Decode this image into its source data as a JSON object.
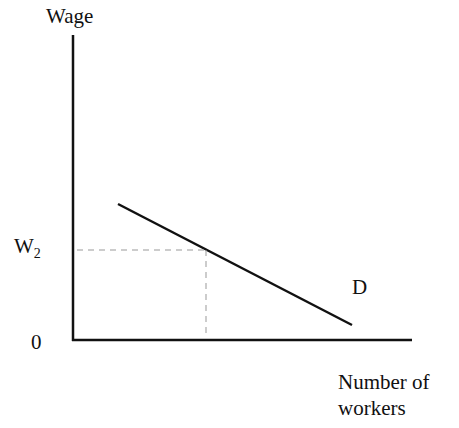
{
  "diagram": {
    "type": "labor-demand-curve",
    "y_axis_label": "Wage",
    "x_axis_label_line1": "Number of",
    "x_axis_label_line2": "workers",
    "origin_label": "0",
    "wage_level_label": "W",
    "wage_level_subscript": "2",
    "curve_label": "D",
    "colors": {
      "line": "#111111",
      "dashed": "#999999",
      "background": "#ffffff"
    }
  }
}
